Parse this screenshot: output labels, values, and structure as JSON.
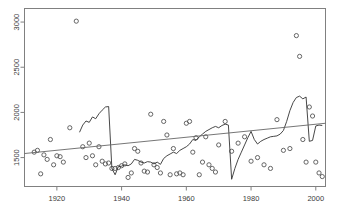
{
  "chart_data": {
    "type": "scatter",
    "title": "",
    "xlabel": "",
    "ylabel": "",
    "xlim": [
      1910,
      2003
    ],
    "ylim": [
      1180,
      3150
    ],
    "grid": false,
    "legend": null,
    "xticks": [
      1920,
      1940,
      1960,
      1980,
      2000
    ],
    "yticks": [
      1500,
      2000,
      2500,
      3000
    ],
    "xtick_labels": [
      "1920",
      "1940",
      "1960",
      "1980",
      "2000"
    ],
    "ytick_labels": [
      "1500",
      "2000",
      "2500",
      "3000"
    ],
    "point_marker": "open-circle",
    "point_color": "#555555",
    "line_color": "#333333",
    "trend_color": "#666666",
    "frame_color": "#808080",
    "series": [
      {
        "name": "observations",
        "type": "scatter",
        "x": [
          1913,
          1914,
          1915,
          1916,
          1917,
          1918,
          1919,
          1920,
          1921,
          1922,
          1924,
          1926,
          1928,
          1929,
          1930,
          1931,
          1932,
          1933,
          1934,
          1935,
          1936,
          1937,
          1938,
          1939,
          1940,
          1941,
          1942,
          1943,
          1944,
          1945,
          1946,
          1947,
          1948,
          1949,
          1950,
          1951,
          1952,
          1953,
          1954,
          1955,
          1956,
          1957,
          1958,
          1959,
          1960,
          1961,
          1962,
          1963,
          1964,
          1965,
          1966,
          1967,
          1968,
          1969,
          1970,
          1972,
          1974,
          1976,
          1978,
          1980,
          1982,
          1984,
          1986,
          1988,
          1990,
          1992,
          1994,
          1995,
          1996,
          1997,
          1998,
          1999,
          2000,
          2001,
          2002
        ],
        "y": [
          1560,
          1580,
          1320,
          1530,
          1480,
          1700,
          1420,
          1520,
          1510,
          1450,
          1830,
          3010,
          1620,
          1500,
          1660,
          1520,
          1420,
          1620,
          1460,
          1430,
          1440,
          1380,
          1380,
          1390,
          1410,
          1430,
          1280,
          1330,
          1600,
          1570,
          1440,
          1350,
          1340,
          1980,
          1420,
          1390,
          1330,
          1900,
          1750,
          1310,
          1600,
          1320,
          1330,
          1310,
          1880,
          1900,
          1560,
          1720,
          1310,
          1450,
          1730,
          1420,
          1380,
          1340,
          1640,
          1900,
          1570,
          1660,
          1730,
          1460,
          1500,
          1420,
          1380,
          1920,
          1580,
          1600,
          2850,
          2620,
          1700,
          1450,
          2060,
          1960,
          1450,
          1330,
          1290
        ]
      },
      {
        "name": "annual-series",
        "type": "line",
        "x": [
          1927,
          1928,
          1929,
          1930,
          1931,
          1932,
          1933,
          1934,
          1935,
          1936,
          1937,
          1938,
          1939,
          1940,
          1941,
          1942,
          1943,
          1944,
          1945,
          1946,
          1947,
          1948,
          1949,
          1950,
          1951,
          1952,
          1953,
          1954,
          1955,
          1956,
          1957,
          1958,
          1959,
          1960,
          1961,
          1962,
          1963,
          1964,
          1965,
          1966,
          1967,
          1968,
          1969,
          1970,
          1971,
          1972,
          1973,
          1974,
          1975,
          1976,
          1977,
          1978,
          1979,
          1980,
          1981,
          1982,
          1983,
          1984,
          1985,
          1986,
          1987,
          1988,
          1989,
          1990,
          1991,
          1992,
          1993,
          1994,
          1995,
          1996,
          1997,
          1998,
          1999,
          2000,
          2001,
          2002
        ],
        "y": [
          1780,
          1860,
          1905,
          1890,
          1950,
          1930,
          1985,
          2025,
          2060,
          2065,
          1380,
          1310,
          1400,
          1405,
          1420,
          1410,
          1430,
          1480,
          1470,
          1450,
          1440,
          1455,
          1450,
          1430,
          1450,
          1425,
          1490,
          1520,
          1540,
          1560,
          1545,
          1580,
          1600,
          1620,
          1650,
          1700,
          1690,
          1730,
          1760,
          1790,
          1810,
          1830,
          1845,
          1830,
          1855,
          1870,
          1860,
          1260,
          1380,
          1480,
          1560,
          1640,
          1720,
          1790,
          1700,
          1650,
          1680,
          1700,
          1715,
          1730,
          1735,
          1740,
          1760,
          1800,
          1900,
          2020,
          2110,
          2165,
          2180,
          2150,
          2170,
          1680,
          1690,
          1850,
          1860,
          1855
        ]
      },
      {
        "name": "trend-line",
        "type": "line",
        "x": [
          1910,
          2003
        ],
        "y": [
          1545,
          1880
        ]
      }
    ]
  }
}
